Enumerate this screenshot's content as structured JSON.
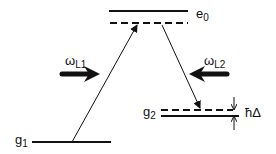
{
  "diagram": {
    "levels": [
      {
        "id": "e0",
        "label": "e",
        "sub": "0"
      },
      {
        "id": "g1",
        "label": "g",
        "sub": "1"
      },
      {
        "id": "g2",
        "label": "g",
        "sub": "2"
      }
    ],
    "lasers": [
      {
        "id": "L1",
        "label": "ω",
        "sub": "L1"
      },
      {
        "id": "L2",
        "label": "ω",
        "sub": "L2"
      }
    ],
    "detuning": {
      "label": "ħΔ"
    },
    "colors": {
      "line": "#111111",
      "background": "#ffffff"
    }
  }
}
